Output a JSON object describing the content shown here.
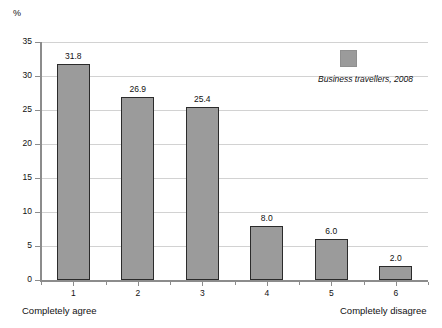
{
  "chart_data": {
    "type": "bar",
    "title": "",
    "subtitle": "",
    "unit_label": "%",
    "xlabel": "",
    "ylabel": "",
    "categories": [
      "1",
      "2",
      "3",
      "4",
      "5",
      "6"
    ],
    "values": [
      31.8,
      26.9,
      25.4,
      8.0,
      6.0,
      2.0
    ],
    "value_labels": [
      "31.8",
      "26.9",
      "25.4",
      "8.0",
      "6.0",
      "2.0"
    ],
    "series": [
      {
        "name": "Business travellers, 2008",
        "values": [
          31.8,
          26.9,
          25.4,
          8.0,
          6.0,
          2.0
        ]
      }
    ],
    "ylim": [
      0,
      35
    ],
    "yticks": [
      0,
      5,
      10,
      15,
      20,
      25,
      30,
      35
    ],
    "ytick_labels": [
      "0",
      "5",
      "10",
      "15",
      "20",
      "25",
      "30",
      "35"
    ],
    "grid": true,
    "legend_position": "top-right",
    "legend_entries": [
      "Business travellers, 2008"
    ],
    "annotations": {
      "scale_low_end": "Completely agree",
      "scale_high_end": "Completely disagree"
    },
    "colors": {
      "bar_fill": "#9b9b9b",
      "bar_border": "#2b2b2b",
      "gridline": "#d2d2d2",
      "axis": "#8c8c8c",
      "text": "#111111",
      "background": "#ffffff"
    }
  }
}
